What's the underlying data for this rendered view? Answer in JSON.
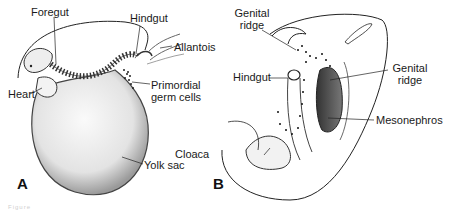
{
  "figure": {
    "panels": [
      {
        "id": "A",
        "label": "A",
        "callouts": {
          "foregut": "Foregut",
          "hindgut": "Hindgut",
          "allantois": "Allantois",
          "heart": "Heart",
          "primordial_germ_cells_1": "Primordial",
          "primordial_germ_cells_2": "germ cells",
          "yolk_sac": "Yolk sac"
        }
      },
      {
        "id": "B",
        "label": "B",
        "callouts": {
          "genital_ridge_top_1": "Genital",
          "genital_ridge_top_2": "ridge",
          "genital_ridge_right_1": "Genital",
          "genital_ridge_right_2": "ridge",
          "hindgut": "Hindgut",
          "cloaca": "Cloaca",
          "mesonephros": "Mesonephros"
        }
      }
    ],
    "caption": "Figure"
  },
  "colors": {
    "line": "#222222",
    "shade_light": "#e6e6e6",
    "shade_dark": "#555555"
  }
}
